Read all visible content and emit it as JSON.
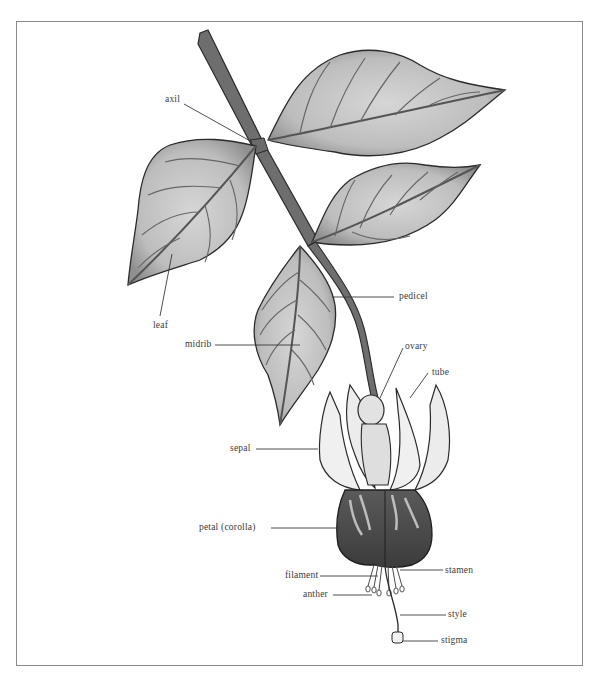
{
  "diagram": {
    "colors": {
      "stem": "#6e6e6e",
      "outline": "#2a2a2a",
      "leaf_fill": "#c9c9c9",
      "leaf_shade": "#a8a8a8",
      "sepal_fill": "#f2f2f2",
      "corolla_fill": "#4a4a4a",
      "leader_line": "#3a3a3a",
      "frame": "#8a8a8a"
    },
    "labels": [
      {
        "id": "axil",
        "text": "axil"
      },
      {
        "id": "leaf",
        "text": "leaf"
      },
      {
        "id": "midrib",
        "text": "midrib"
      },
      {
        "id": "pedicel",
        "text": "pedicel"
      },
      {
        "id": "ovary",
        "text": "ovary"
      },
      {
        "id": "tube",
        "text": "tube"
      },
      {
        "id": "sepal",
        "text": "sepal"
      },
      {
        "id": "petal",
        "text": "petal (corolla)"
      },
      {
        "id": "filament",
        "text": "filament"
      },
      {
        "id": "stamen",
        "text": "stamen"
      },
      {
        "id": "anther",
        "text": "anther"
      },
      {
        "id": "style",
        "text": "style"
      },
      {
        "id": "stigma",
        "text": "stigma"
      }
    ]
  }
}
